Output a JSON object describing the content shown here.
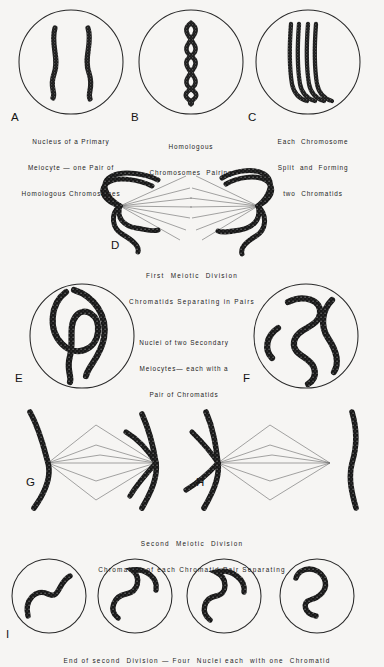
{
  "figure": {
    "background_color": "#f6f5f3",
    "ink_color": "#1a1a1a",
    "circle_stroke_color": "#2a2a2a",
    "spindle_fiber_color": "#6b6b6b"
  },
  "panels": [
    {
      "id": "A",
      "label": "A",
      "caption_lines": [
        "Nucleus of a Primary",
        "Meiocyte — one Pair of",
        "Homologous Chromosomes"
      ],
      "content": "two-separate-wavy-chromosomes"
    },
    {
      "id": "B",
      "label": "B",
      "caption_lines": [
        "Homologous",
        "Chromosomes  Pairing"
      ],
      "content": "two-chromosomes-twisted-helix"
    },
    {
      "id": "C",
      "label": "C",
      "caption_lines": [
        "Each  Chromosome",
        "Split  and  Forming",
        "two  Chromatids"
      ],
      "content": "four-parallel-chromatids"
    },
    {
      "id": "D",
      "label": "D",
      "caption_lines": [
        "First  Meiotic  Division",
        "Chromatids Separating in Pairs"
      ],
      "content": "anaphase-one-two-spindles"
    },
    {
      "id": "E",
      "label": "E",
      "caption_lines": [],
      "content": "secondary-meiocyte-nucleus-left"
    },
    {
      "id": "F",
      "label": "F",
      "caption_lines": [],
      "content": "secondary-meiocyte-nucleus-right"
    },
    {
      "id": "G",
      "label": "G",
      "caption_lines": [],
      "content": "second-division-spindle-left"
    },
    {
      "id": "H",
      "label": "H",
      "caption_lines": [],
      "content": "second-division-spindle-right"
    },
    {
      "id": "I",
      "label": "I",
      "caption_lines": [],
      "content": "four-resulting-nuclei"
    }
  ],
  "captions": {
    "ef_block": [
      "Nuclei of two Secondary",
      "Meiocytes— each with a",
      "Pair of Chromatids"
    ],
    "gh_block": [
      "Second  Meiotic  Division",
      "Chromatids of each Chromatid Pair Separating"
    ],
    "i_block": [
      "End of second  Division — Four  Nuclei each  with one  Chromatid"
    ]
  }
}
